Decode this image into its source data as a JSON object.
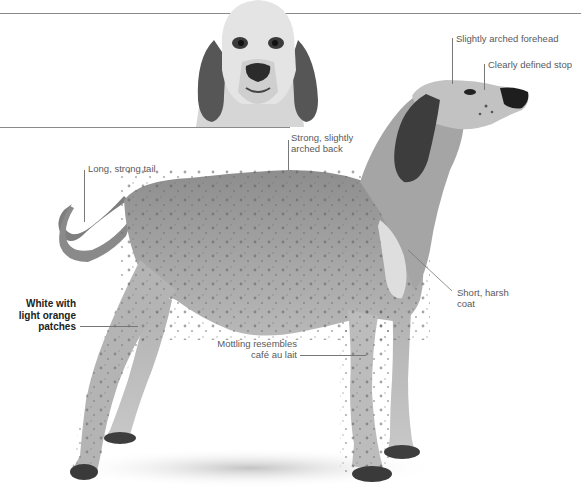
{
  "page": {
    "background": "#ffffff",
    "style": "grayscale breed profile illustration"
  },
  "inset_photo": {
    "subject": "dog head, front view",
    "description": "Front-facing portrait of hound head with long drooping ears"
  },
  "main_photo": {
    "subject": "dog full body, side profile",
    "description": "Mottled hound standing in profile facing right"
  },
  "annotations": [
    {
      "id": "forehead",
      "text": "Slightly arched forehead"
    },
    {
      "id": "stop",
      "text": "Clearly defined stop"
    },
    {
      "id": "back",
      "line1": "Strong, slightly",
      "line2": "arched back"
    },
    {
      "id": "tail",
      "text": "Long, strong tail"
    },
    {
      "id": "coat_color",
      "line1": "White with",
      "line2": "light orange",
      "line3": "patches"
    },
    {
      "id": "mottling",
      "line1": "Mottling resembles",
      "line2": "café au lait"
    },
    {
      "id": "coat_texture",
      "line1": "Short, harsh",
      "line2": "coat"
    }
  ]
}
